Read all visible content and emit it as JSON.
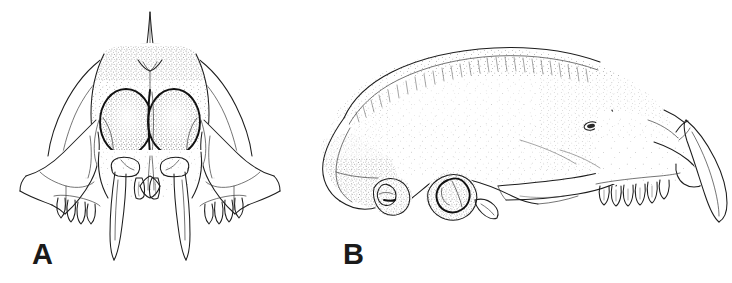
{
  "figure": {
    "kind": "scientific-illustration",
    "technique": "pen-and-ink stipple line drawing",
    "background_color": "#ffffff",
    "ink_color": "#1d1d1d",
    "label_color": "#1a1a1a",
    "width_px": 732,
    "height_px": 283,
    "panel_count": 2
  },
  "panels": [
    {
      "id": "A",
      "label": "A",
      "view": "anterior",
      "label_position": {
        "x": 32,
        "y": 240
      },
      "bounds": {
        "x": 12,
        "y": 10,
        "width": 280,
        "height": 245
      },
      "features": [
        "sagittal crest spike",
        "left orbit",
        "right orbit",
        "interorbital septum",
        "left zygomatic arch",
        "right zygomatic arch",
        "left saber canine",
        "right saber canine",
        "incisor row",
        "left cheek tooth row",
        "right cheek tooth row",
        "stippled frontal shading"
      ]
    },
    {
      "id": "B",
      "label": "B",
      "view": "lateral",
      "label_position": {
        "x": 343,
        "y": 240
      },
      "bounds": {
        "x": 320,
        "y": 45,
        "width": 405,
        "height": 200
      },
      "features": [
        "hatched dorsal sagittal crest",
        "occipital region",
        "posterior auditory bulla",
        "anterior auditory bulla",
        "zygomatic arch",
        "oval foramen upper",
        "oval foramen lower",
        "maxillary cheek tooth row",
        "lateral saber canine",
        "stippled cranial shading"
      ]
    }
  ]
}
